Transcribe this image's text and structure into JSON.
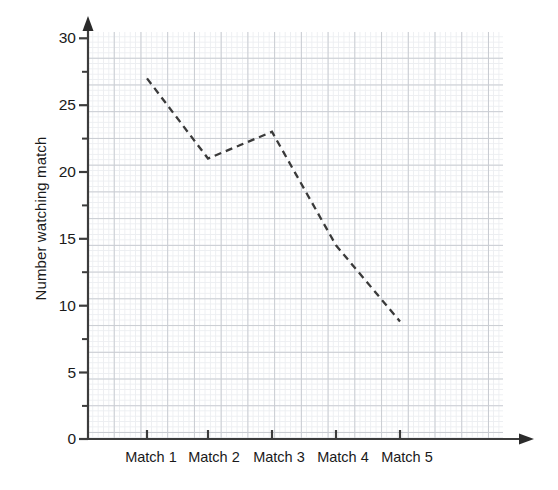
{
  "chart_data": {
    "type": "line",
    "title": "",
    "subtitle": "",
    "xlabel": "",
    "ylabel": "Number watching match",
    "categories": [
      "Match 1",
      "Match 2",
      "Match 3",
      "Match 4",
      "Match 5"
    ],
    "values": [
      27,
      21,
      23,
      14.5,
      8.8
    ],
    "series": [
      {
        "name": "Number watching match",
        "values": [
          27,
          21,
          23,
          14.5,
          8.8
        ],
        "line_style": "dashed",
        "color": "#3a3a3a",
        "markers": false
      }
    ],
    "ylim": [
      0,
      30
    ],
    "y_major_ticks": [
      0,
      5,
      10,
      15,
      20,
      25,
      30
    ],
    "y_minor_ticks": [
      2.5,
      7.5,
      12.5,
      17.5,
      22.5,
      27.5
    ],
    "y_tick_labels": [
      "0",
      "5",
      "10",
      "15",
      "20",
      "25",
      "30"
    ],
    "x_tick_labels": [
      "Match 1",
      "Match 2",
      "Match 3",
      "Match 4",
      "Match 5"
    ],
    "grid": true,
    "grid_type": "graph-paper-minor-and-major",
    "legend": false,
    "legend_position": "none",
    "axis_arrows": [
      "y-up",
      "x-right"
    ],
    "background_color": "#ffffff",
    "grid_minor_color": "#eceef1",
    "grid_major_color": "#c9ccd2",
    "axis_color": "#3c3c3c"
  },
  "axes": {
    "y_title": "Number watching match",
    "y_labels": [
      {
        "text": "30",
        "value": 30
      },
      {
        "text": "25",
        "value": 25
      },
      {
        "text": "20",
        "value": 20
      },
      {
        "text": "15",
        "value": 15
      },
      {
        "text": "10",
        "value": 10
      },
      {
        "text": "5",
        "value": 5
      },
      {
        "text": "0",
        "value": 0
      }
    ],
    "x_labels": [
      {
        "text": "Match 1",
        "index": 0
      },
      {
        "text": "Match 2",
        "index": 1
      },
      {
        "text": "Match 3",
        "index": 2
      },
      {
        "text": "Match 4",
        "index": 3
      },
      {
        "text": "Match 5",
        "index": 4
      }
    ]
  }
}
